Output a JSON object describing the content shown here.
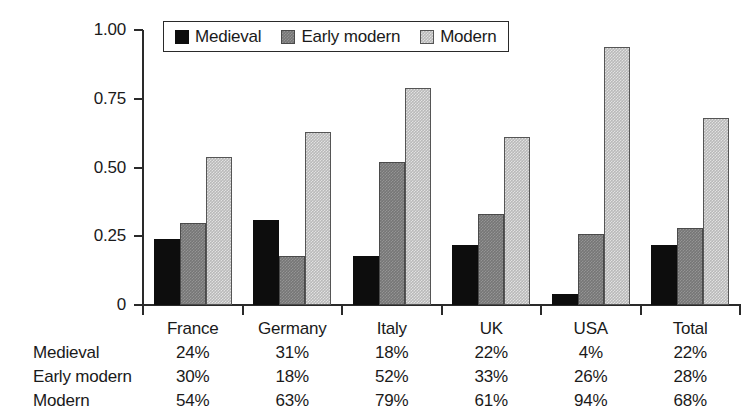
{
  "chart_data": {
    "type": "bar",
    "title": "",
    "subtitle": "",
    "xlabel": "",
    "ylabel": "",
    "ylim": [
      0,
      1.0
    ],
    "yticks": [
      "0",
      "0.25",
      "0.50",
      "0.75",
      "1.00"
    ],
    "ytick_values": [
      0,
      0.25,
      0.5,
      0.75,
      1.0
    ],
    "grid": false,
    "legend_position": "top-left-inside",
    "categories": [
      "France",
      "Germany",
      "Italy",
      "UK",
      "USA",
      "Total"
    ],
    "series": [
      {
        "name": "Medieval",
        "color": "#0d0d0d",
        "values": [
          0.24,
          0.31,
          0.18,
          0.22,
          0.04,
          0.22
        ]
      },
      {
        "name": "Early modern",
        "color": "#767676",
        "values": [
          0.3,
          0.18,
          0.52,
          0.33,
          0.26,
          0.28
        ]
      },
      {
        "name": "Modern",
        "color": "#b9b9b9",
        "values": [
          0.54,
          0.63,
          0.79,
          0.61,
          0.94,
          0.68
        ]
      }
    ]
  },
  "legend": {
    "items": [
      {
        "label": "Medieval",
        "swatch": "medieval-swatch"
      },
      {
        "label": "Early modern",
        "swatch": "early-modern-swatch"
      },
      {
        "label": "Modern",
        "swatch": "modern-swatch"
      }
    ]
  },
  "table": {
    "column_headers": [
      "France",
      "Germany",
      "Italy",
      "UK",
      "USA",
      "Total"
    ],
    "rows": [
      {
        "label": "Medieval",
        "values": [
          "24%",
          "31%",
          "18%",
          "22%",
          "4%",
          "22%"
        ]
      },
      {
        "label": "Early modern",
        "values": [
          "30%",
          "18%",
          "52%",
          "33%",
          "26%",
          "28%"
        ]
      },
      {
        "label": "Modern",
        "values": [
          "54%",
          "63%",
          "79%",
          "61%",
          "94%",
          "68%"
        ]
      }
    ]
  }
}
